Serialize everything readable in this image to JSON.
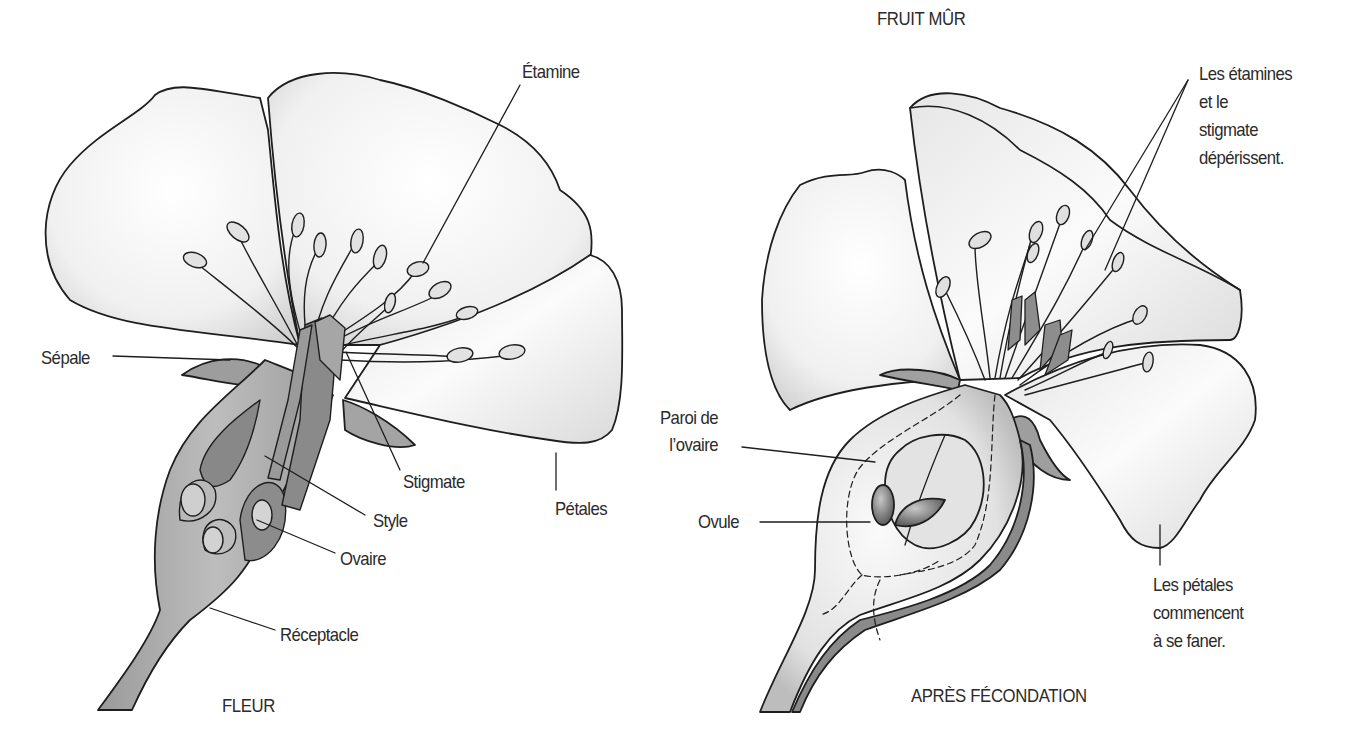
{
  "diagram": {
    "type": "botanical cross-section",
    "panels": [
      {
        "id": "flower",
        "caption": "FLEUR",
        "labels": {
          "etamine": "Étamine",
          "sepale": "Sépale",
          "stigmate": "Stigmate",
          "petales": "Pétales",
          "style": "Style",
          "ovaire": "Ovaire",
          "receptacle": "Réceptacle"
        }
      },
      {
        "id": "after-fertilization",
        "caption": "APRÈS FÉCONDATION",
        "top_caption": "FRUIT MÛR",
        "labels": {
          "etamines_deperissent": "Les étamines\net le\nstigmate\ndépérissent.",
          "paroi_ovaire": "Paroi de\nl’ovaire",
          "ovule": "Ovule",
          "petales_fanent": "Les pétales\ncommencent\nà se faner."
        }
      }
    ],
    "colors": {
      "outline": "#1e1e1e",
      "petal_light": "#f4f4f4",
      "petal_shade": "#d6d6d6",
      "tissue_mid": "#a9a9a9",
      "tissue_dark": "#7d7d7d",
      "background": "#ffffff"
    }
  }
}
